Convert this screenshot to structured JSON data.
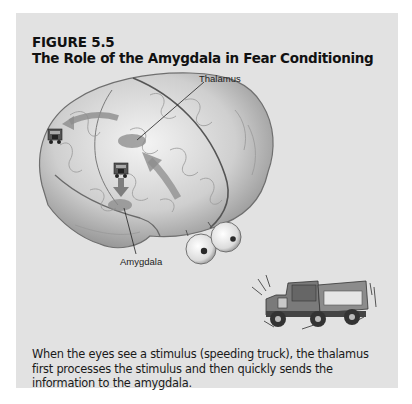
{
  "figure": {
    "number": "FIGURE 5.5",
    "title": "The Role of the Amygdala in Fear Conditioning",
    "caption": "When the eyes see a stimulus (speeding truck), the thalamus first processes the stimulus and then quickly sends the information to the amygdala."
  },
  "illustration": {
    "labels": {
      "thalamus": "Thalamus",
      "amygdala": "Amygdala"
    },
    "elements": [
      "brain-illustration",
      "eyes-icon",
      "speeding-truck-icon",
      "truck-icon-cortex",
      "truck-icon-thalamus",
      "arrow-eyes-to-thalamus",
      "arrow-thalamus-to-amygdala",
      "arrow-thalamus-to-cortex"
    ]
  },
  "colors": {
    "panel": "#e2e2e2",
    "region_highlight": "#8a8a8a",
    "arrow": "#8c8c8c"
  }
}
